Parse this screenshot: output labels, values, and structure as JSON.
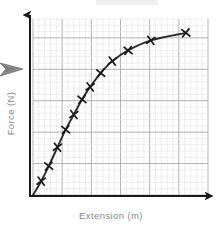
{
  "figure": {
    "kind": "hand-drawn-graph",
    "axes": {
      "x_label": "Extension (m)",
      "y_label": "Force (N)",
      "x_arrowhead": true,
      "y_arrowhead": true,
      "axis_color": "#1a1a1a",
      "label_color": "#8a8a8a"
    },
    "grid": {
      "minor_cols": 30,
      "minor_rows": 28,
      "major_every": 5,
      "minor_color": "#e2e2e2",
      "major_color": "#aaaaaa",
      "background": "#ffffff",
      "visible": true
    },
    "artifacts": {
      "pointer_arrow_color": "#8c8c8c",
      "smudge_color": "#f0f0f0"
    }
  },
  "chart_data": {
    "type": "line",
    "title": "",
    "subtitle": "",
    "xlabel": "Extension (m)",
    "ylabel": "Force (N)",
    "xlim": [
      0,
      30
    ],
    "ylim": [
      0,
      28
    ],
    "grid": true,
    "legend": null,
    "marker": "x",
    "marker_color": "#1a1a1a",
    "line_color": "#2b2b2b",
    "annotations": [],
    "series": [
      {
        "name": "Force vs Extension",
        "x": [
          1.4,
          2.7,
          4.2,
          5.6,
          7.0,
          8.4,
          9.8,
          11.6,
          13.6,
          16.3,
          20.2,
          26.2
        ],
        "y": [
          2.2,
          4.6,
          7.6,
          10.4,
          12.8,
          15.2,
          17.2,
          19.4,
          21.3,
          23.0,
          24.6,
          25.8
        ]
      }
    ]
  }
}
